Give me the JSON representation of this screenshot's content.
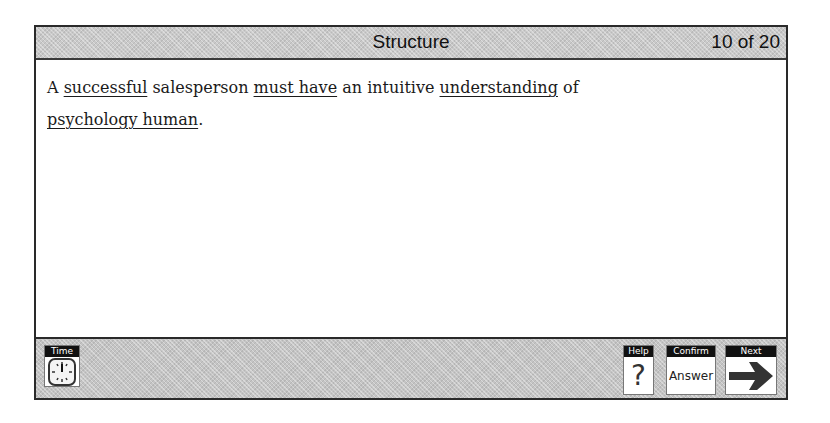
{
  "header": {
    "title": "Structure",
    "counter": "10 of 20"
  },
  "question": {
    "segments": [
      {
        "text": "A ",
        "underlined": false
      },
      {
        "text": "successful",
        "underlined": true
      },
      {
        "text": " salesperson ",
        "underlined": false
      },
      {
        "text": "must have",
        "underlined": true
      },
      {
        "text": " an intuitive ",
        "underlined": false
      },
      {
        "text": "understanding",
        "underlined": true
      },
      {
        "text": " of ",
        "underlined": false
      },
      {
        "text": "psychology human",
        "underlined": true
      },
      {
        "text": ".",
        "underlined": false
      }
    ]
  },
  "footer": {
    "time": {
      "label": "Time",
      "icon": "clock-icon"
    },
    "help": {
      "label": "Help",
      "glyph": "?",
      "icon": "question-mark-icon"
    },
    "confirm": {
      "label": "Confirm",
      "text": "Answer"
    },
    "next": {
      "label": "Next",
      "icon": "right-arrow-icon"
    }
  }
}
